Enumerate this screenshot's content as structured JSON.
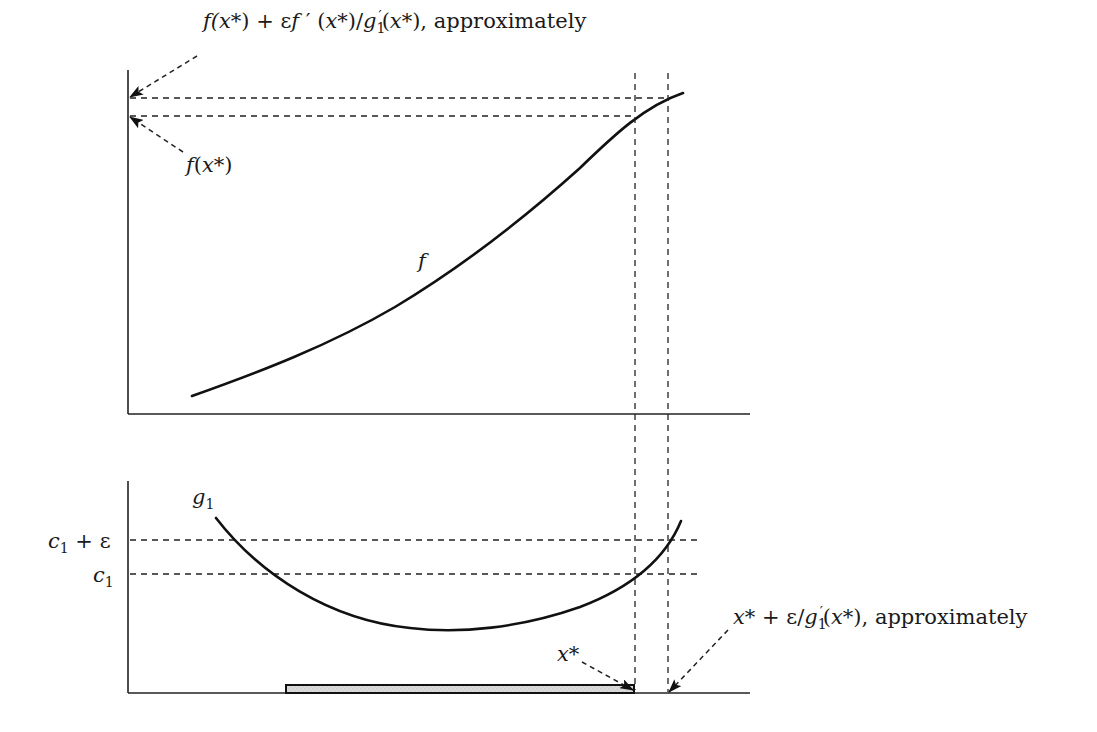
{
  "figure": {
    "top_panel": {
      "curve_label": "f",
      "annotation_upper": {
        "parts": [
          "f(",
          "x",
          "*) + ε",
          "f",
          " ′ (",
          "x",
          "*)/",
          "g",
          "1",
          "′",
          "(",
          "x",
          "*), approximately"
        ],
        "plain": "f(x*) + εf′(x*)/g1′(x*), approximately"
      },
      "annotation_lower": {
        "parts": [
          "f",
          "(",
          "x",
          "*)"
        ],
        "plain": "f(x*)"
      }
    },
    "bottom_panel": {
      "curve_label": {
        "main": "g",
        "sub": "1"
      },
      "level_upper": {
        "main": "c",
        "sub": "1",
        "rest": " + ε",
        "plain": "c1 + ε"
      },
      "level_lower": {
        "main": "c",
        "sub": "1",
        "plain": "c1"
      },
      "point_label": {
        "main": "x",
        "rest": "*",
        "plain": "x*"
      },
      "annotation_right": {
        "parts": [
          "x",
          "* + ε/",
          "g",
          "1",
          "′",
          "(",
          "x",
          "*), approximately"
        ],
        "plain": "x* + ε/g1′(x*), approximately"
      },
      "shaded_interval": "feasible region shown as shaded bar on x-axis up to x*"
    },
    "colors": {
      "line": "#111111",
      "shade": "#d6d6d6",
      "background": "#ffffff"
    }
  }
}
